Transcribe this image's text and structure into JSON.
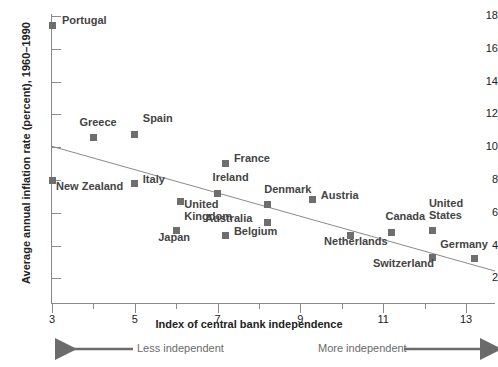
{
  "chart_data": {
    "type": "scatter",
    "title": "",
    "xlabel": "Index of central bank independence",
    "ylabel": "Average annual inflation rate (percent), 1960–1990",
    "xlim": [
      3,
      13.7
    ],
    "ylim": [
      2,
      18
    ],
    "xticks": [
      3,
      5,
      7,
      9,
      11,
      13
    ],
    "xticks_minor": [
      4,
      6,
      8,
      10,
      12
    ],
    "yticks": [
      2,
      4,
      6,
      8,
      10,
      12,
      14,
      16,
      18
    ],
    "grid": false,
    "legend": "none",
    "marker_color": "#6e6e6e",
    "line_color": "#8a8a8a",
    "points": [
      {
        "label": "Portugal",
        "x": 3.0,
        "y": 17.4,
        "lx": 10,
        "ly": -6
      },
      {
        "label": "New Zealand",
        "x": 3.0,
        "y": 8.0,
        "lx": 4,
        "ly": 6
      },
      {
        "label": "Greece",
        "x": 4.0,
        "y": 10.6,
        "lx": -14,
        "ly": -15
      },
      {
        "label": "Spain",
        "x": 5.0,
        "y": 10.8,
        "lx": 8,
        "ly": -16
      },
      {
        "label": "Italy",
        "x": 5.0,
        "y": 7.8,
        "lx": 8,
        "ly": -4
      },
      {
        "label": "Japan",
        "x": 6.0,
        "y": 4.9,
        "lx": -18,
        "ly": 6
      },
      {
        "label": "United\nKingdom",
        "x": 6.1,
        "y": 6.7,
        "lx": 4,
        "ly": 3
      },
      {
        "label": "Ireland",
        "x": 7.0,
        "y": 7.2,
        "lx": -5,
        "ly": -16
      },
      {
        "label": "France",
        "x": 7.2,
        "y": 9.0,
        "lx": 8,
        "ly": -6
      },
      {
        "label": "Belgium",
        "x": 7.2,
        "y": 4.6,
        "lx": 8,
        "ly": -5
      },
      {
        "label": "Denmark",
        "x": 8.2,
        "y": 6.5,
        "lx": -3,
        "ly": -16
      },
      {
        "label": "Australia",
        "x": 8.2,
        "y": 5.4,
        "lx": -62,
        "ly": -5
      },
      {
        "label": "Austria",
        "x": 9.3,
        "y": 6.8,
        "lx": 8,
        "ly": -5
      },
      {
        "label": "Netherlands",
        "x": 10.2,
        "y": 4.6,
        "lx": -26,
        "ly": 5
      },
      {
        "label": "Canada",
        "x": 11.2,
        "y": 4.8,
        "lx": -6,
        "ly": -16
      },
      {
        "label": "Switzerland",
        "x": 12.2,
        "y": 3.3,
        "lx": -60,
        "ly": 6
      },
      {
        "label": "United\nStates",
        "x": 12.2,
        "y": 4.9,
        "lx": -4,
        "ly": -28
      },
      {
        "label": "Germany",
        "x": 13.2,
        "y": 3.2,
        "lx": -34,
        "ly": -15
      }
    ],
    "trendline": {
      "x1": 3.0,
      "y1": 10.05,
      "x2": 13.7,
      "y2": 2.45
    },
    "annotations": {
      "left_arrow_text": "Less independent",
      "right_arrow_text": "More independent"
    }
  }
}
